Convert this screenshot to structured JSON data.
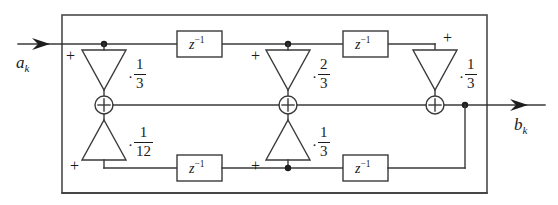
{
  "diagram": {
    "input_label": "a",
    "input_subscript": "k",
    "output_label": "b",
    "output_subscript": "k",
    "delay_label": "z",
    "delay_exponent": "−1",
    "colors": {
      "wire": "#3a3a3a",
      "frame": "#4a4a4a",
      "node": "#1e1e1e",
      "background": "#ffffff"
    },
    "delays": [
      {
        "id": "delay-top-left",
        "text": "z",
        "exponent": "−1"
      },
      {
        "id": "delay-top-right",
        "text": "z",
        "exponent": "−1"
      },
      {
        "id": "delay-bottom-left",
        "text": "z",
        "exponent": "−1"
      },
      {
        "id": "delay-bottom-right",
        "text": "z",
        "exponent": "−1"
      }
    ],
    "gains": [
      {
        "id": "gain-top-1",
        "dot": "·",
        "numerator": "1",
        "denominator": "3",
        "value": 0.3333333333333333
      },
      {
        "id": "gain-top-2",
        "dot": "·",
        "numerator": "2",
        "denominator": "3",
        "value": 0.6666666666666666
      },
      {
        "id": "gain-top-3",
        "dot": "·",
        "numerator": "1",
        "denominator": "3",
        "value": 0.3333333333333333
      },
      {
        "id": "gain-bottom-1",
        "dot": "·",
        "numerator": "1",
        "denominator": "12",
        "value": 0.08333333333333333
      },
      {
        "id": "gain-bottom-2",
        "dot": "·",
        "numerator": "1",
        "denominator": "3",
        "value": 0.3333333333333333
      }
    ],
    "plus_signs": [
      {
        "id": "plus-top-left",
        "text": "+"
      },
      {
        "id": "plus-top-middle",
        "text": "+"
      },
      {
        "id": "plus-top-right",
        "text": "+"
      },
      {
        "id": "plus-bottom-left",
        "text": "+"
      },
      {
        "id": "plus-bottom-middle",
        "text": "+"
      }
    ],
    "adders": [
      {
        "id": "adder-left",
        "symbol": "+"
      },
      {
        "id": "adder-middle",
        "symbol": "+"
      },
      {
        "id": "adder-right",
        "symbol": "+"
      }
    ]
  }
}
